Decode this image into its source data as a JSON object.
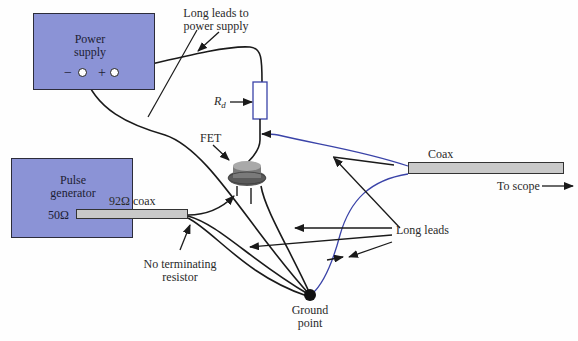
{
  "diagram": {
    "power_supply": {
      "title_line1": "Power",
      "title_line2": "supply",
      "minus": "−",
      "plus": "+"
    },
    "pulse_generator": {
      "title_line1": "Pulse",
      "title_line2": "generator",
      "impedance": "50Ω"
    },
    "labels": {
      "long_leads_ps_line1": "Long leads to",
      "long_leads_ps_line2": "power supply",
      "rd_main": "R",
      "rd_sub": "d",
      "fet": "FET",
      "coax_92": "92Ω coax",
      "no_term_line1": "No terminating",
      "no_term_line2": "resistor",
      "coax": "Coax",
      "to_scope": "To scope",
      "long_leads": "Long leads",
      "ground_line1": "Ground",
      "ground_line2": "point"
    },
    "colors": {
      "box_fill": "#8b93d6",
      "coax_fill": "#c9c9c9",
      "wire": "#1a1a1a",
      "blue_wire": "#3a43a8"
    }
  }
}
